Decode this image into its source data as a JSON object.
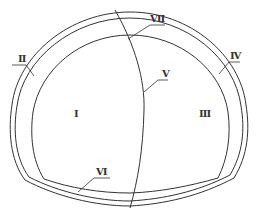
{
  "diagram": {
    "title": "",
    "type": "tunnel-cross-section",
    "colors": {
      "stroke": "#333333",
      "background": "#ffffff"
    },
    "regions": [
      {
        "id": "I",
        "label": "Ⅰ",
        "description": "left inner section"
      },
      {
        "id": "III",
        "label": "Ⅲ",
        "description": "right inner section"
      }
    ],
    "callouts": [
      {
        "id": "II",
        "label": "Ⅱ",
        "target": "left outer lining"
      },
      {
        "id": "IV",
        "label": "Ⅳ",
        "target": "right outer lining"
      },
      {
        "id": "V",
        "label": "Ⅴ",
        "target": "dividing curve"
      },
      {
        "id": "VI",
        "label": "Ⅵ",
        "target": "invert lining"
      },
      {
        "id": "VII",
        "label": "Ⅶ",
        "target": "crown lining"
      }
    ]
  }
}
